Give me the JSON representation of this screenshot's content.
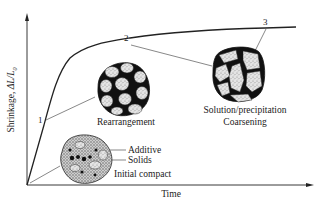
{
  "diagram": {
    "type": "sintering-stages-shrinkage-curve",
    "axes": {
      "x_label": "Time",
      "y_label_prefix": "Shrinkage, ",
      "y_label_formula": "ΔL/L",
      "y_label_subscript": "0"
    },
    "stage_points": [
      {
        "id": "1",
        "label": "1"
      },
      {
        "id": "2",
        "label": "2"
      },
      {
        "id": "3",
        "label": "3"
      }
    ],
    "microstructures": [
      {
        "name": "initial-compact",
        "labels": [
          "Additive",
          "Solids",
          "Initial compact"
        ]
      },
      {
        "name": "rearrangement",
        "labels": [
          "Rearrangement"
        ]
      },
      {
        "name": "solution-precipitation",
        "labels": [
          "Solution/precipitation",
          "Coarsening"
        ]
      }
    ],
    "colors": {
      "line": "#222222",
      "leader": "#555555",
      "grain_fill": "#d8d8d8",
      "pore": "#111111",
      "background": "#ffffff"
    }
  }
}
